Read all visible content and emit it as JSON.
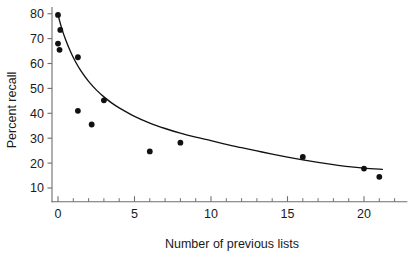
{
  "chart_data": {
    "type": "scatter",
    "title": "",
    "subtitle": "",
    "xlabel": "Number of previous lists",
    "ylabel": "Percent recall",
    "xlim": [
      -0.9,
      22.8
    ],
    "ylim": [
      4.5,
      82.5
    ],
    "grid": false,
    "legend": null,
    "x_ticks": [
      0,
      5,
      10,
      15,
      20
    ],
    "x_tick_labels": [
      "0",
      "5",
      "10",
      "15",
      "20"
    ],
    "x_minor_tick_step": 1,
    "y_ticks": [
      10,
      20,
      30,
      40,
      50,
      60,
      70,
      80
    ],
    "y_tick_labels": [
      "10",
      "20",
      "30",
      "40",
      "50",
      "60",
      "70",
      "80"
    ],
    "point_color": "#111111",
    "curve_color": "#111111",
    "axis_color": "#6e6e6e",
    "background_color": "#ffffff",
    "series": [
      {
        "name": "Observed percent recall",
        "marker": "filled-circle",
        "points": [
          {
            "x": 0.0,
            "y": 79.5
          },
          {
            "x": 0.15,
            "y": 73.5
          },
          {
            "x": 0.0,
            "y": 68.0
          },
          {
            "x": 0.1,
            "y": 65.5
          },
          {
            "x": 1.3,
            "y": 62.5
          },
          {
            "x": 1.3,
            "y": 41.0
          },
          {
            "x": 2.2,
            "y": 35.5
          },
          {
            "x": 3.0,
            "y": 45.2
          },
          {
            "x": 6.0,
            "y": 24.7
          },
          {
            "x": 8.0,
            "y": 28.2
          },
          {
            "x": 16.0,
            "y": 22.5
          },
          {
            "x": 20.0,
            "y": 17.8
          },
          {
            "x": 21.0,
            "y": 14.5
          }
        ]
      }
    ],
    "fit_curve": {
      "name": "Fitted decay curve",
      "description": "Smooth monotonically decreasing power/exponential fit",
      "points": [
        {
          "x": 0.0,
          "y": 79.5
        },
        {
          "x": 0.25,
          "y": 74.0
        },
        {
          "x": 0.5,
          "y": 69.5
        },
        {
          "x": 0.8,
          "y": 65.0
        },
        {
          "x": 1.1,
          "y": 61.2
        },
        {
          "x": 1.5,
          "y": 57.0
        },
        {
          "x": 2.0,
          "y": 52.8
        },
        {
          "x": 2.5,
          "y": 49.4
        },
        {
          "x": 3.0,
          "y": 46.6
        },
        {
          "x": 3.5,
          "y": 44.2
        },
        {
          "x": 4.0,
          "y": 42.2
        },
        {
          "x": 5.0,
          "y": 38.8
        },
        {
          "x": 6.0,
          "y": 36.1
        },
        {
          "x": 7.0,
          "y": 33.9
        },
        {
          "x": 8.0,
          "y": 32.0
        },
        {
          "x": 9.0,
          "y": 30.4
        },
        {
          "x": 10.0,
          "y": 29.0
        },
        {
          "x": 11.0,
          "y": 27.5
        },
        {
          "x": 12.0,
          "y": 26.2
        },
        {
          "x": 13.0,
          "y": 24.9
        },
        {
          "x": 14.0,
          "y": 23.6
        },
        {
          "x": 15.0,
          "y": 22.4
        },
        {
          "x": 16.0,
          "y": 21.3
        },
        {
          "x": 17.0,
          "y": 20.3
        },
        {
          "x": 18.0,
          "y": 19.4
        },
        {
          "x": 19.0,
          "y": 18.6
        },
        {
          "x": 20.0,
          "y": 18.0
        },
        {
          "x": 21.2,
          "y": 17.5
        }
      ]
    }
  }
}
